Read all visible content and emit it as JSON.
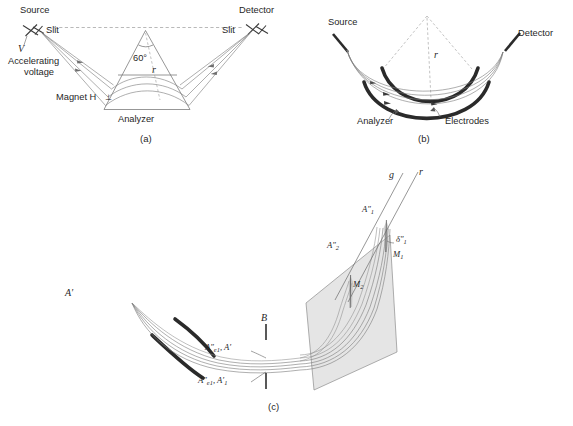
{
  "figure": {
    "background_color": "#ffffff",
    "ink_color": "#1f1f1f",
    "plate_color": "#2a2a2a",
    "ray_color": "#7d7d7d",
    "plane_color": "#cfcfcf"
  },
  "panel_a": {
    "caption": "(a)",
    "type": "magnetic-sector-analyzer",
    "labels": {
      "source": "Source",
      "slit_left": "Slit",
      "accelerating_voltage_line1": "Accelerating",
      "accelerating_voltage_line2": "voltage",
      "voltage_symbol": "V",
      "angle": "60°",
      "radius_symbol": "r",
      "magnet": "Magnet H",
      "magnet_perp": "⊥",
      "analyzer": "Analyzer",
      "slit_right": "Slit",
      "detector": "Detector"
    }
  },
  "panel_b": {
    "caption": "(b)",
    "type": "electrostatic-sector-analyzer",
    "labels": {
      "source": "Source",
      "detector": "Detector",
      "radius_symbol": "r",
      "analyzer": "Analyzer",
      "electrodes": "Electrodes"
    }
  },
  "panel_c": {
    "caption": "(c)",
    "type": "double-focusing-mass-spectrometer-3d",
    "labels": {
      "a_prime": "A′",
      "image_top_e": "A″",
      "image_top_e_sub": "e1",
      "image_top_second": ", A′",
      "image_bottom_e": "A″",
      "image_bottom_e_sub": "e1",
      "image_bottom_second": ", A′",
      "image_bottom_second_sub": "1",
      "slit_b": "B",
      "line_g": "g",
      "line_r": "r",
      "image_a1": "A″",
      "image_a1_sub": "1",
      "image_a2": "A″",
      "image_a2_sub": "2",
      "delta": "δ″",
      "delta_sub": "1",
      "m1": "M",
      "m1_sub": "1",
      "m2": "M",
      "m2_sub": "2"
    }
  }
}
